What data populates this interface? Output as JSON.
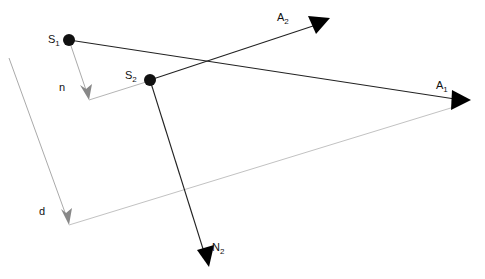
{
  "diagram": {
    "colors": {
      "dark_line": "#222222",
      "gray_line": "#aaaaaa",
      "gray_arrow": "#888888",
      "dot": "#111111",
      "arrowhead": "#000000"
    },
    "points": {
      "S1": {
        "label": "S",
        "subscript": "1",
        "x": 69,
        "y": 40
      },
      "S2": {
        "label": "S",
        "subscript": "2",
        "x": 150,
        "y": 80
      }
    },
    "rays": [
      {
        "name": "A1",
        "label": "A",
        "subscript": "1",
        "from": "S1",
        "tip": [
          471,
          100
        ]
      },
      {
        "name": "A2",
        "label": "A",
        "subscript": "2",
        "from": "S2",
        "tip": [
          330,
          18
        ]
      },
      {
        "name": "N2",
        "label": "N",
        "subscript": "2",
        "from": "S2",
        "tip": [
          209,
          267
        ]
      }
    ],
    "vectors": [
      {
        "name": "n",
        "label": "n",
        "from": [
          69,
          40
        ],
        "tip": [
          89,
          100
        ]
      },
      {
        "name": "d",
        "label": "d",
        "from": [
          9,
          58
        ],
        "tip": [
          69,
          225
        ]
      }
    ],
    "labels": {
      "S1_main": "S",
      "S1_sub": "1",
      "S2_main": "S",
      "S2_sub": "2",
      "A1_main": "A",
      "A1_sub": "1",
      "A2_main": "A",
      "A2_sub": "2",
      "N2_main": "N",
      "N2_sub": "2",
      "n": "n",
      "d": "d"
    }
  }
}
